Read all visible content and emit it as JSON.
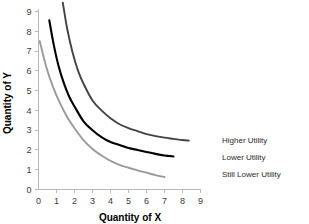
{
  "chart_data": {
    "type": "line",
    "title": "",
    "xlabel": "Quantity of X",
    "ylabel": "Quantity of Y",
    "xlim": [
      0,
      9
    ],
    "ylim": [
      0,
      9
    ],
    "xticks": [
      "0",
      "1",
      "2",
      "3",
      "4",
      "5",
      "6",
      "7",
      "8",
      "9"
    ],
    "yticks": [
      "0",
      "1",
      "2",
      "3",
      "4",
      "5",
      "6",
      "7",
      "8",
      "9"
    ],
    "grid": false,
    "legend_position": "right-inline",
    "series": [
      {
        "name": "Higher Utility",
        "color": "#434343",
        "label": "Higher Utility",
        "x": [
          1.35,
          1.6,
          1.9,
          2.2,
          2.5,
          3.0,
          3.5,
          4.0,
          4.5,
          5.0,
          5.5,
          6.0,
          6.5,
          7.0,
          7.5,
          8.0,
          8.35
        ],
        "y": [
          9.45,
          8.1,
          6.9,
          6.0,
          5.35,
          4.5,
          4.0,
          3.6,
          3.3,
          3.1,
          2.95,
          2.8,
          2.7,
          2.62,
          2.56,
          2.5,
          2.47
        ]
      },
      {
        "name": "Lower Utility",
        "color": "#000000",
        "label": "Lower Utility",
        "x": [
          0.6,
          0.85,
          1.1,
          1.4,
          1.7,
          2.0,
          2.5,
          3.0,
          3.5,
          4.0,
          4.5,
          5.0,
          5.5,
          6.0,
          6.5,
          7.0,
          7.5
        ],
        "y": [
          8.55,
          7.3,
          6.3,
          5.4,
          4.7,
          4.2,
          3.45,
          3.0,
          2.65,
          2.4,
          2.25,
          2.1,
          2.0,
          1.9,
          1.8,
          1.72,
          1.67
        ]
      },
      {
        "name": "Still Lower Utility",
        "color": "#9a9a9a",
        "label": "Still Lower Utility",
        "x": [
          0.07,
          0.4,
          0.8,
          1.2,
          1.6,
          2.0,
          2.5,
          3.0,
          3.5,
          4.0,
          4.5,
          5.0,
          5.5,
          6.0,
          6.5,
          7.0
        ],
        "y": [
          7.5,
          6.3,
          5.2,
          4.35,
          3.65,
          3.1,
          2.5,
          2.05,
          1.72,
          1.45,
          1.25,
          1.1,
          0.97,
          0.85,
          0.73,
          0.63
        ]
      }
    ]
  },
  "labels": {
    "higher_utility": "Higher Utility",
    "lower_utility": "Lower Utility",
    "still_lower_utility": "Still Lower Utility",
    "x_axis_title": "Quantity of X",
    "y_axis_title": "Quantity of Y"
  }
}
